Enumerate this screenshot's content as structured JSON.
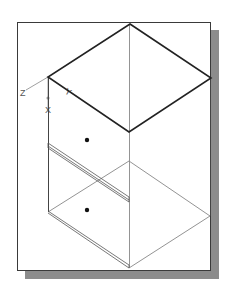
{
  "caption": {
    "text": "",
    "note": "top caption clipped / illegible"
  },
  "viewport": {
    "frame": {
      "x": 17,
      "y": 22,
      "width": 194,
      "height": 249,
      "border_color": "#3a3a3a",
      "background": "#ffffff"
    },
    "shadow": {
      "offset_x": 8,
      "offset_y": 8,
      "color": "#8c8c8c"
    }
  },
  "ucs_icon": {
    "labels": {
      "z": "Z",
      "y": "Y",
      "x": "X"
    },
    "origin": [
      48,
      77
    ],
    "color": "#666666"
  },
  "model": {
    "name": "isometric box wireframe",
    "top_face_color": "#222222",
    "edge_color": "#555555",
    "thin_edge_color": "#777777",
    "holes": 2
  }
}
